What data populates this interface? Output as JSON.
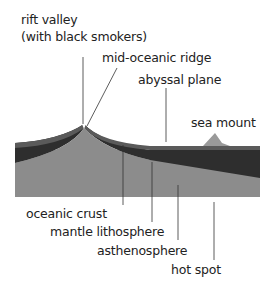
{
  "labels": {
    "rift_valley_line1": "rift valley",
    "rift_valley_line2": "(with black smokers)",
    "mid_oceanic_ridge": "mid-oceanic ridge",
    "abyssal_plane": "abyssal plane",
    "sea_mount": "sea mount",
    "oceanic_crust": "oceanic crust",
    "mantle_lithosphere": "mantle lithosphere",
    "asthenosphere": "asthenosphere",
    "hot_spot": "hot spot"
  },
  "colors": {
    "crust": "#5a5a5a",
    "mantle_lithosphere": "#2e2e2e",
    "asthenosphere": "#8c8c8c",
    "sea_mount": "#9a9a9a",
    "leader_line": "#333333"
  }
}
